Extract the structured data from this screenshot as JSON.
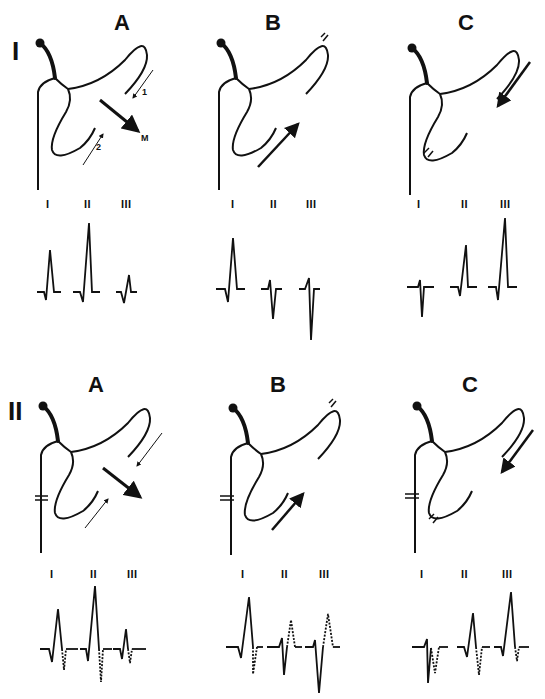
{
  "figure": {
    "rows": [
      {
        "label": "I",
        "panels": [
          {
            "label": "A",
            "arrow_labels": [
              "1",
              "2",
              "M"
            ]
          },
          {
            "label": "B"
          },
          {
            "label": "C"
          }
        ]
      },
      {
        "label": "II",
        "panels": [
          {
            "label": "A"
          },
          {
            "label": "B"
          },
          {
            "label": "C"
          }
        ]
      }
    ],
    "leads": [
      "I",
      "II",
      "III"
    ],
    "colors": {
      "ink": "#111111",
      "background": "#ffffff"
    }
  }
}
